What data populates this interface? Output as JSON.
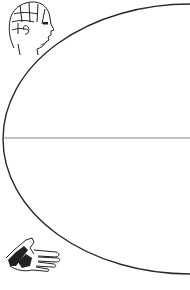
{
  "diagram": {
    "type": "half-ellipse-with-axis",
    "colors": {
      "stroke": "#2a2a2a",
      "axis": "#8a8a8a",
      "background": "#ffffff"
    },
    "ellipse": {
      "cx": 190,
      "cy": 139,
      "rx": 187,
      "ry": 135
    },
    "axis": {
      "x1": 4,
      "y1": 138,
      "x2": 190,
      "y2": 138
    },
    "illustrations": [
      {
        "name": "phrenology-head",
        "position": "top-left"
      },
      {
        "name": "pointing-hand",
        "position": "bottom-left"
      }
    ]
  }
}
